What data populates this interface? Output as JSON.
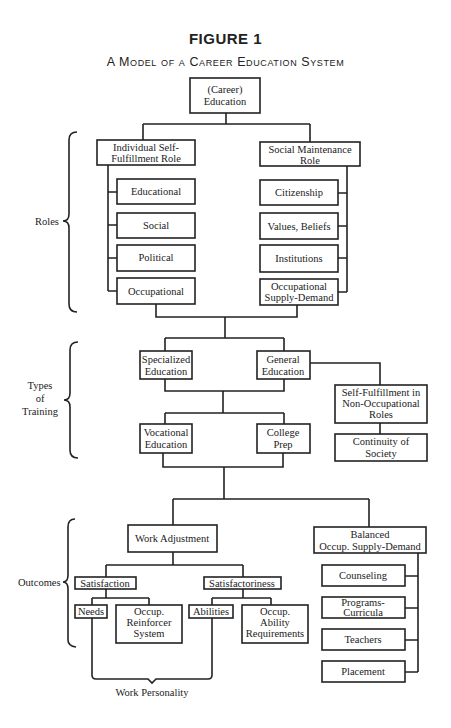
{
  "header": {
    "title": "FIGURE 1",
    "subtitle": "A Model of a Career Education System"
  },
  "sections": {
    "roles": "Roles",
    "training": [
      "Types",
      "of",
      "Training"
    ],
    "outcomes": "Outcomes"
  },
  "nodes": {
    "career": [
      "(Career)",
      "Education"
    ],
    "isf_role": [
      "Individual Self-",
      "Fulfillment Role"
    ],
    "smr_role": [
      "Social Maintenance",
      "Role"
    ],
    "isf_children": [
      [
        "Educational"
      ],
      [
        "Social"
      ],
      [
        "Political"
      ],
      [
        "Occupational"
      ]
    ],
    "smr_children": [
      [
        "Citizenship"
      ],
      [
        "Values, Beliefs"
      ],
      [
        "Institutions"
      ],
      [
        "Occupational",
        "Supply-Demand"
      ]
    ],
    "specialized": [
      "Specialized",
      "Education"
    ],
    "general": [
      "General",
      "Education"
    ],
    "vocational": [
      "Vocational",
      "Education"
    ],
    "college": [
      "College",
      "Prep"
    ],
    "sfnor": [
      "Self-Fulfillment in",
      "Non-Occupational",
      "Roles"
    ],
    "continuity": [
      "Continuity of",
      "Society"
    ],
    "work_adjustment": [
      "Work Adjustment"
    ],
    "satisfaction": [
      "Satisfaction"
    ],
    "satisfactoriness": [
      "Satisfactoriness"
    ],
    "needs": [
      "Needs"
    ],
    "reinforcer": [
      "Occup.",
      "Reinforcer",
      "System"
    ],
    "abilities": [
      "Abilities"
    ],
    "ability_req": [
      "Occup.",
      "Ability",
      "Requirements"
    ],
    "balanced": [
      "Balanced",
      "Occup. Supply-Demand"
    ],
    "balanced_children": [
      [
        "Counseling"
      ],
      [
        "Programs-",
        "Curricula"
      ],
      [
        "Teachers"
      ],
      [
        "Placement"
      ]
    ],
    "work_personality": "Work Personality"
  }
}
